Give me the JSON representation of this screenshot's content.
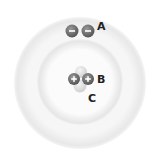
{
  "diagram": {
    "type": "atom-model",
    "labels": {
      "a": "A",
      "b": "B",
      "c": "C"
    },
    "electrons": [
      {
        "sign": "−"
      },
      {
        "sign": "−"
      }
    ],
    "protons": [
      {
        "sign": "+"
      },
      {
        "sign": "+"
      }
    ],
    "neutrons_count": 2,
    "colors": {
      "shell": "#ececec",
      "particle_charged": "#6f6f6f",
      "particle_neutral": "#dcdcdc",
      "label": "#222222"
    }
  }
}
